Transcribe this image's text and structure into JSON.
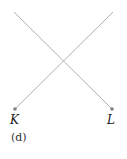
{
  "diagram": {
    "caption": "(d)",
    "points": [
      {
        "label": "K",
        "x": 15,
        "y": 109
      },
      {
        "label": "L",
        "x": 112,
        "y": 109
      }
    ],
    "lines": [
      {
        "from": [
          14,
          12
        ],
        "to": [
          112,
          109
        ]
      },
      {
        "from": [
          113,
          12
        ],
        "to": [
          15,
          109
        ]
      }
    ],
    "line_color": "#b0b0b0",
    "point_color": "#808080"
  }
}
